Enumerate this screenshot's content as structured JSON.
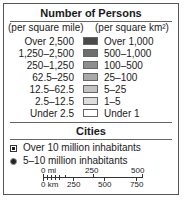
{
  "legend": {
    "title": "Number of Persons",
    "units_left": "(per square mile)",
    "units_right": "(per square km²)",
    "rows": [
      {
        "mile": "Over 2,500",
        "km": "Over 1,000",
        "color": "#4a4a4a"
      },
      {
        "mile": "1,250–2,500",
        "km": "500–1,000",
        "color": "#6e6e6e"
      },
      {
        "mile": "250–1,250",
        "km": "100–500",
        "color": "#8e8e8e"
      },
      {
        "mile": "62.5–250",
        "km": "25–100",
        "color": "#a9a9a9"
      },
      {
        "mile": "12.5–62.5",
        "km": "5–25",
        "color": "#c4c4c4"
      },
      {
        "mile": "2.5–12.5",
        "km": "1–5",
        "color": "#dedede"
      },
      {
        "mile": "Under 2.5",
        "km": "Under 1",
        "color": "#ffffff"
      }
    ]
  },
  "cities": {
    "title": "Cities",
    "items": [
      {
        "label": "Over 10 million inhabitants",
        "symbol": "square-dot-icon"
      },
      {
        "label": "5–10 million inhabitants",
        "symbol": "dot-icon"
      }
    ]
  },
  "scale": {
    "mi_labels": [
      "0 mi",
      "250",
      "500"
    ],
    "km_labels": [
      "0 km",
      "250",
      "500",
      "750"
    ]
  }
}
